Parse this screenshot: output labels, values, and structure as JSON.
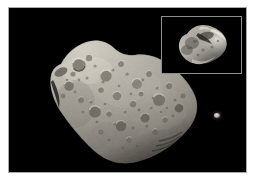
{
  "image": {
    "kind": "astronomical-photograph",
    "background_color": "#000000",
    "matte_color": "#ffffff",
    "frame_border_color": "#a9a9a9",
    "width": 255,
    "height": 184
  },
  "main_subject": {
    "name": "asteroid",
    "label": "Asteroid",
    "surface_tone_light": "#cfcabf",
    "surface_tone_mid": "#9a958b",
    "surface_tone_dark": "#3a372f",
    "terminator_shadow": "#0b0b0a",
    "description": "Large elongated cratered asteroid lit from upper left, spanning diagonally from upper left to lower right"
  },
  "moon": {
    "name": "moon-point",
    "label": "Moon",
    "color": "#e8e4dc",
    "position": {
      "x": 214,
      "y": 120
    },
    "size_px": 6
  },
  "inset": {
    "name": "inset-closeup",
    "label": "Close-up inset",
    "border_color": "#8e8e8e",
    "background_color": "#000000",
    "subject_label": "Moon close-up",
    "subject_tone_light": "#ded9cf",
    "subject_tone_mid": "#8d8880",
    "subject_tone_dark": "#2a2824",
    "rect": {
      "x": 152,
      "y": 8,
      "width": 81,
      "height": 58
    }
  },
  "alt_text": "Black-and-white spacecraft photograph of a large, heavily cratered elongated asteroid against black space, with a small bright moon at right and a boxed close-up inset of the moon in the upper right corner."
}
